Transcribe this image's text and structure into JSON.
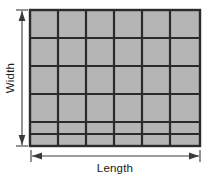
{
  "figure": {
    "labels": {
      "width": "Width",
      "length": "Length"
    },
    "colors": {
      "cell_fill": "#b5b5b5",
      "grid_line": "#2b2b2b",
      "outline": "#2b2b2b",
      "arrow": "#3a3a3a",
      "text": "#1a1a1a",
      "background": "#ffffff"
    },
    "grid": {
      "columns": 6,
      "full_rows": 4,
      "partial_rows": 1,
      "total_cells_visible": 30,
      "rect": {
        "x": 30,
        "y": 10,
        "width": 170,
        "height": 136
      },
      "column_dividers_x": [
        58,
        86,
        114,
        142,
        170
      ],
      "row_dividers_y": [
        38,
        66,
        94,
        122
      ],
      "partial_row_y": 134
    },
    "dimension_arrows": {
      "width_arrow": {
        "orientation": "vertical",
        "x": 22,
        "y1": 10,
        "y2": 146,
        "double_headed": true,
        "end_caps": "tick"
      },
      "length_arrow": {
        "orientation": "horizontal",
        "y": 156,
        "x1": 31,
        "x2": 200,
        "double_headed": true,
        "end_caps": "tick"
      }
    }
  }
}
